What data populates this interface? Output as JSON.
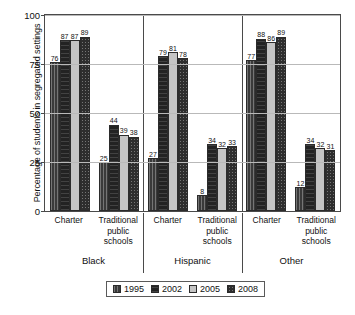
{
  "chart_data": {
    "type": "bar",
    "title": "",
    "xlabel": "",
    "ylabel": "Percentage of students in segregated settings",
    "ylim": [
      0,
      100
    ],
    "yticks": [
      "0",
      "25",
      "50",
      "75",
      "100"
    ],
    "grid": true,
    "legend_position": "bottom",
    "series": [
      {
        "name": "1995",
        "values": [
          76,
          25,
          27,
          8,
          77,
          12
        ]
      },
      {
        "name": "2002",
        "values": [
          87,
          44,
          79,
          34,
          88,
          34
        ]
      },
      {
        "name": "2005",
        "values": [
          87,
          39,
          81,
          32,
          86,
          32
        ]
      },
      {
        "name": "2008",
        "values": [
          89,
          38,
          78,
          33,
          89,
          31
        ]
      }
    ],
    "categories": [
      "Charter",
      "Traditional public schools",
      "Charter",
      "Traditional public schools",
      "Charter",
      "Traditional public schools"
    ],
    "category_lines": [
      [
        "Charter"
      ],
      [
        "Traditional",
        "public",
        "schools"
      ],
      [
        "Charter"
      ],
      [
        "Traditional",
        "public",
        "schools"
      ],
      [
        "Charter"
      ],
      [
        "Traditional",
        "public",
        "schools"
      ]
    ],
    "groups": [
      "Black",
      "Hispanic",
      "Other"
    ],
    "series_colors": [
      "#3a3a3a",
      "#232323",
      "#c4c4c4",
      "#2e2e2e"
    ]
  },
  "axis": {
    "y_title": "Percentage of students in segregated settings",
    "tick_100": "100",
    "tick_75": "75",
    "tick_50": "50",
    "tick_25": "25",
    "tick_0": "0"
  },
  "groups": {
    "g0": "Black",
    "g1": "Hispanic",
    "g2": "Other"
  },
  "legend": {
    "items": [
      {
        "label": "1995"
      },
      {
        "label": "2002"
      },
      {
        "label": "2005"
      },
      {
        "label": "2008"
      }
    ]
  }
}
